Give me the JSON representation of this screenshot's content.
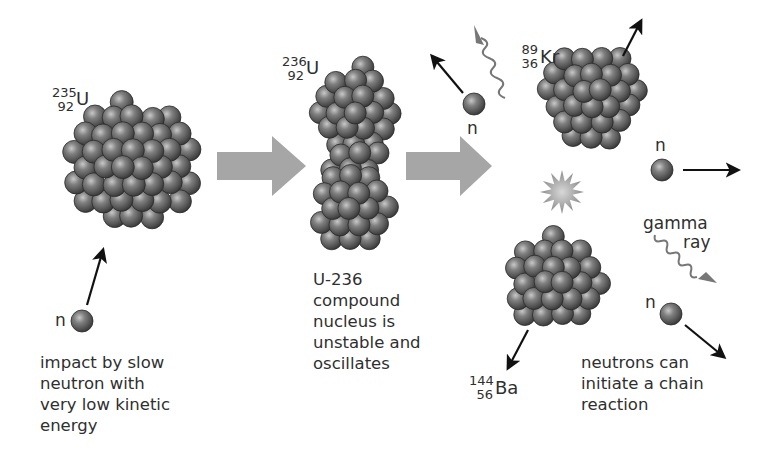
{
  "colors": {
    "nucleon": "#5e5e5e",
    "nucleon_highlight": "#bdbdbd",
    "nucleon_edge": "#2a2a2a",
    "process_arrow": "#a6a6a6",
    "gamma_ray": "#777777",
    "direction_arrow": "#111111",
    "flash": "#9a9a9a",
    "text": "#2f2f2f"
  },
  "icons": {
    "process_arrow": "gray-block-arrow-right",
    "neutron": "gray-sphere",
    "gamma": "wavy-arrow",
    "flash": "starburst"
  },
  "stages": [
    {
      "id": "u235",
      "isotope": {
        "mass": "235",
        "atomic": "92",
        "symbol": "U"
      },
      "neutron_label": "n",
      "caption": [
        "impact by slow",
        "neutron with",
        "very low kinetic",
        "energy"
      ]
    },
    {
      "id": "u236",
      "isotope": {
        "mass": "236",
        "atomic": "92",
        "symbol": "U"
      },
      "caption": [
        "U-236",
        "compound",
        "nucleus is",
        "unstable and",
        "oscillates"
      ]
    },
    {
      "id": "products",
      "krypton": {
        "mass": "89",
        "atomic": "36",
        "symbol": "Kr"
      },
      "barium": {
        "mass": "144",
        "atomic": "56",
        "symbol": "Ba"
      },
      "neutron_labels": [
        "n",
        "n",
        "n"
      ],
      "gamma_label": [
        "gamma",
        "ray"
      ],
      "caption": [
        "neutrons can",
        "initiate a chain",
        "reaction"
      ]
    }
  ]
}
